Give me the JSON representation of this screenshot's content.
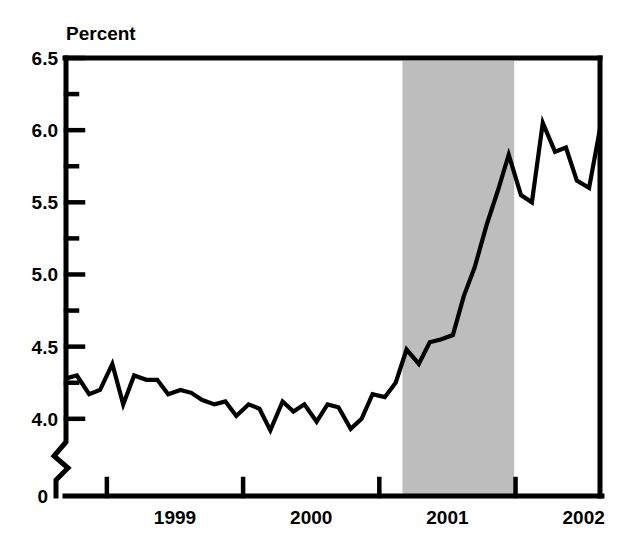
{
  "chart_data": {
    "type": "line",
    "title": "",
    "subtitle": "",
    "ylabel": "Percent",
    "xlabel": "",
    "ylim": [
      3.75,
      6.5
    ],
    "y_axis_break": true,
    "y_break_value": 0,
    "ytick_labels": [
      "6.5",
      "6.0",
      "5.5",
      "5.0",
      "4.5",
      "4.0",
      "0"
    ],
    "ytick_values": [
      6.5,
      6.0,
      5.5,
      5.0,
      4.5,
      4.0,
      0
    ],
    "yminor_tick_values": [
      6.25,
      5.75,
      5.25,
      4.75,
      4.25
    ],
    "grid": false,
    "legend": "none",
    "xlim": [
      1998.7,
      2002.62
    ],
    "xtick_labels": [
      "1999",
      "2000",
      "2001",
      "2002"
    ],
    "xtick_label_positions": [
      1999.5,
      2000.5,
      2001.5,
      2002.5
    ],
    "xtick_boundary_values": [
      1999.0,
      2000.0,
      2001.0,
      2002.0
    ],
    "shaded_regions": [
      {
        "label": "recession",
        "x_start": 2001.17,
        "x_end": 2001.99,
        "color": "#bdbdbd"
      }
    ],
    "series": [
      {
        "name": "Unemployment rate",
        "color": "#000000",
        "x": [
          1998.7,
          1998.78,
          1998.87,
          1998.95,
          1999.04,
          1999.12,
          1999.2,
          1999.29,
          1999.37,
          1999.45,
          1999.54,
          1999.62,
          1999.7,
          1999.79,
          1999.87,
          1999.95,
          2000.04,
          2000.12,
          2000.2,
          2000.29,
          2000.37,
          2000.45,
          2000.54,
          2000.62,
          2000.7,
          2000.79,
          2000.87,
          2000.95,
          2001.04,
          2001.12,
          2001.2,
          2001.29,
          2001.37,
          2001.45,
          2001.54,
          2001.62,
          2001.7,
          2001.79,
          2001.87,
          2001.95,
          2002.04,
          2002.12,
          2002.2,
          2002.29,
          2002.37,
          2002.45,
          2002.54,
          2002.62
        ],
        "values": [
          4.28,
          4.3,
          4.17,
          4.2,
          4.38,
          4.1,
          4.3,
          4.27,
          4.27,
          4.17,
          4.2,
          4.18,
          4.13,
          4.1,
          4.12,
          4.02,
          4.1,
          4.07,
          3.92,
          4.12,
          4.05,
          4.1,
          3.98,
          4.1,
          4.08,
          3.93,
          4.0,
          4.17,
          4.15,
          4.25,
          4.48,
          4.38,
          4.53,
          4.55,
          4.58,
          4.85,
          5.05,
          5.35,
          5.58,
          5.83,
          5.55,
          5.5,
          6.05,
          5.85,
          5.88,
          5.65,
          5.6,
          6.01
        ]
      }
    ]
  },
  "plot_geometry": {
    "left_px": 66,
    "right_px": 600,
    "top_px": 58,
    "bottom_px": 496,
    "y_value_top": 6.5,
    "y_value_bottom_pre_break": 3.97,
    "break_px": 470
  },
  "colors": {
    "line": "#000000",
    "frame": "#000000",
    "recession_band": "#bdbdbd",
    "background": "#ffffff"
  }
}
